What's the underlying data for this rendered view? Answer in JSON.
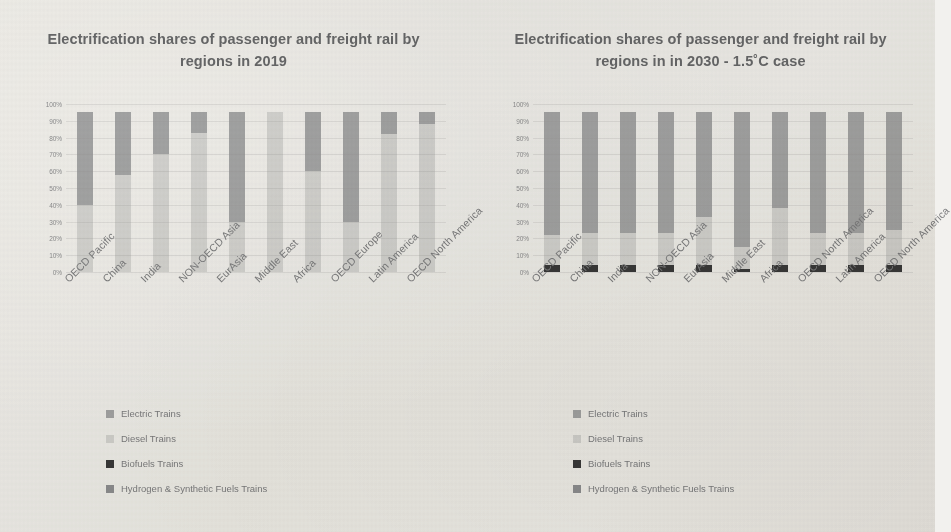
{
  "series_colors": {
    "electric": "#a5a6a7",
    "diesel": "#d5d5d3",
    "biofuels": "#3a3a3a",
    "hydrogen": "#8f9093"
  },
  "legend": {
    "items": [
      {
        "label": "Electric Trains",
        "key": "electric"
      },
      {
        "label": "Diesel Trains",
        "key": "diesel"
      },
      {
        "label": "Biofuels Trains",
        "key": "biofuels"
      },
      {
        "label": "Hydrogen & Synthetic Fuels Trains",
        "key": "hydrogen"
      }
    ]
  },
  "y_ticks": [
    "100%",
    "90%",
    "80%",
    "70%",
    "60%",
    "50%",
    "40%",
    "30%",
    "20%",
    "10%",
    "0%"
  ],
  "chart_data": [
    {
      "type": "bar",
      "stacked": true,
      "title": "Electrification shares of passenger and freight rail by regions in 2019",
      "xlabel": "",
      "ylabel": "",
      "ylim": [
        0,
        100
      ],
      "grid": true,
      "legend_position": "bottom-left",
      "categories": [
        "OECD Pacific",
        "China",
        "India",
        "NON-OECD Asia",
        "EurAsia",
        "Middle East",
        "Africa",
        "OECD Europe",
        "Latin America",
        "OECD North America"
      ],
      "series": [
        {
          "name": "Diesel Trains",
          "key": "diesel",
          "values": [
            40,
            58,
            70,
            83,
            30,
            95,
            60,
            30,
            82,
            88
          ]
        },
        {
          "name": "Electric Trains",
          "key": "electric",
          "values": [
            55,
            37,
            25,
            12,
            65,
            0,
            35,
            65,
            13,
            7
          ]
        },
        {
          "name": "Biofuels Trains",
          "key": "biofuels",
          "values": [
            0,
            0,
            0,
            0,
            0,
            0,
            0,
            0,
            0,
            0
          ]
        },
        {
          "name": "Hydrogen & Synthetic Fuels Trains",
          "key": "hydrogen",
          "values": [
            0,
            0,
            0,
            0,
            0,
            0,
            0,
            0,
            0,
            0
          ]
        }
      ]
    },
    {
      "type": "bar",
      "stacked": true,
      "title": "Electrification shares of passenger and freight rail by regions in in 2030 - 1.5˚C case",
      "xlabel": "",
      "ylabel": "",
      "ylim": [
        0,
        100
      ],
      "grid": true,
      "legend_position": "bottom-left",
      "categories": [
        "OECD Pacific",
        "China",
        "India",
        "NON-OECD Asia",
        "EurAsia",
        "Middle East",
        "Africa",
        "OECD North America",
        "Latin America",
        "OECD North America"
      ],
      "series": [
        {
          "name": "Biofuels Trains",
          "key": "biofuels",
          "values": [
            4,
            4,
            4,
            4,
            4,
            2,
            4,
            4,
            4,
            4
          ]
        },
        {
          "name": "Diesel Trains",
          "key": "diesel",
          "values": [
            18,
            19,
            19,
            19,
            29,
            13,
            34,
            19,
            19,
            21
          ]
        },
        {
          "name": "Electric Trains",
          "key": "electric",
          "values": [
            73,
            72,
            72,
            72,
            62,
            80,
            57,
            72,
            72,
            70
          ]
        },
        {
          "name": "Hydrogen & Synthetic Fuels Trains",
          "key": "hydrogen",
          "values": [
            0,
            0,
            0,
            0,
            0,
            0,
            0,
            0,
            0,
            0
          ]
        }
      ]
    }
  ],
  "charts": [
    {
      "categories": [
        "OECD Pacific",
        "China",
        "India",
        "NON-OECD Asia",
        "EurAsia",
        "Middle East",
        "Africa",
        "OECD Europe",
        "Latin America",
        "OECD North America"
      ]
    },
    {
      "categories": [
        "OECD Pacific",
        "China",
        "India",
        "NON-OECD Asia",
        "EurAsia",
        "Middle East",
        "Africa",
        "OECD Europe",
        "Latin America",
        "OECD North America"
      ]
    }
  ]
}
